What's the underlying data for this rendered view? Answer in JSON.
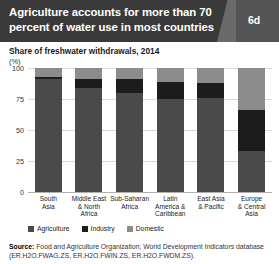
{
  "header": {
    "title": "Agriculture accounts for more than 70 percent of water use in most countries",
    "badge": "6d"
  },
  "subtitle": "Share of freshwater withdrawals, 2014",
  "axis_unit": "(%)",
  "source": {
    "label": "Source:",
    "text": " Food and Agriculture Organization; World Development Indicators database (ER.H2O.FWAG.ZS, ER.H2O.FWIN.ZS, ER.H2O.FWDM.ZS)."
  },
  "colors": {
    "agriculture": "#4a4a4a",
    "industry": "#1c1c1c",
    "domestic": "#8c8c8c",
    "header_band": "#3a3a3a",
    "header_block": "#555555"
  },
  "chart_data": {
    "type": "bar",
    "title": "Agriculture accounts for more than 70 percent of water use in most countries",
    "subtitle": "Share of freshwater withdrawals, 2014",
    "xlabel": "",
    "ylabel": "(%)",
    "ylim": [
      0,
      100
    ],
    "yticks": [
      0,
      25,
      50,
      75,
      100
    ],
    "ytick_labels": [
      "0",
      "25",
      "50",
      "75",
      "100"
    ],
    "grid": true,
    "stacked": true,
    "legend_position": "bottom-left",
    "categories": [
      "South Asia",
      "Middle East & North Africa",
      "Sub-Saharan Africa",
      "Latin America & Caribbean",
      "East Asia & Pacific",
      "Europe & Central Asia"
    ],
    "category_lines": [
      [
        "South",
        "Asia"
      ],
      [
        "Middle East",
        "& North",
        "Africa"
      ],
      [
        "Sub-Saharan",
        "Africa"
      ],
      [
        "Latin",
        "America &",
        "Caribbean"
      ],
      [
        "East Asia",
        "& Pacific"
      ],
      [
        "Europe",
        "& Central",
        "Asia"
      ]
    ],
    "series": [
      {
        "name": "Agriculture",
        "color": "#4a4a4a",
        "values": [
          91,
          84,
          80,
          75,
          76,
          33
        ]
      },
      {
        "name": "Industry",
        "color": "#1c1c1c",
        "values": [
          2,
          7,
          11,
          14,
          12,
          33
        ]
      },
      {
        "name": "Domestic",
        "color": "#8c8c8c",
        "values": [
          7,
          9,
          9,
          11,
          12,
          34
        ]
      }
    ]
  }
}
